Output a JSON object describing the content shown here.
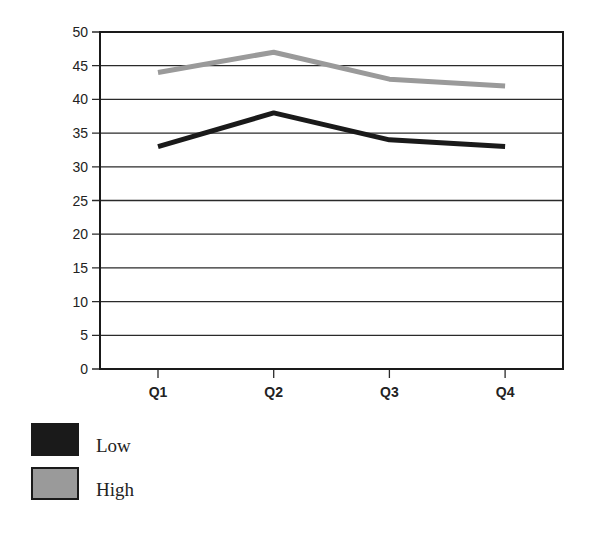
{
  "chart_data": {
    "type": "line",
    "title": "",
    "xlabel": "",
    "ylabel": "",
    "categories": [
      "Q1",
      "Q2",
      "Q3",
      "Q4"
    ],
    "series": [
      {
        "name": "Low",
        "values": [
          33,
          38,
          34,
          33
        ],
        "color": "#1a1a1a"
      },
      {
        "name": "High",
        "values": [
          44,
          47,
          43,
          42
        ],
        "color": "#9a9a9a"
      }
    ],
    "ylim": [
      0,
      50
    ],
    "yticks": [
      0,
      5,
      10,
      15,
      20,
      25,
      30,
      35,
      40,
      45,
      50
    ],
    "grid": true,
    "legend_position": "bottom-left"
  },
  "legend": {
    "items": [
      {
        "label": "Low",
        "color": "#1a1a1a"
      },
      {
        "label": "High",
        "color": "#9a9a9a"
      }
    ]
  }
}
